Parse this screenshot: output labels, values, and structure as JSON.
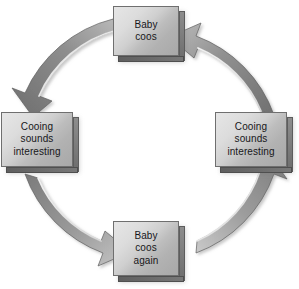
{
  "diagram": {
    "type": "cycle-diagram",
    "direction": "counterclockwise",
    "colors": {
      "background": "#ffffff",
      "box_face_light": "#e6e6e6",
      "box_face_dark": "#a8a8a8",
      "box_border": "#6f6f6f",
      "box_side": "#6d6d6d",
      "ring_light": "#d9d9d9",
      "ring_mid": "#9a9a9a",
      "ring_dark": "#6b6b6b",
      "text": "#17171a"
    },
    "nodes": [
      {
        "id": "top",
        "position": "top",
        "lines": [
          "Baby",
          "coos"
        ]
      },
      {
        "id": "left",
        "position": "left",
        "lines": [
          "Cooing",
          "sounds",
          "interesting"
        ]
      },
      {
        "id": "bottom",
        "position": "bottom",
        "lines": [
          "Baby",
          "coos",
          "again"
        ]
      },
      {
        "id": "right",
        "position": "right",
        "lines": [
          "Cooing",
          "sounds",
          "interesting"
        ]
      }
    ],
    "arrows": [
      {
        "id": "top-to-left",
        "from": "top",
        "to": "left",
        "label": ""
      },
      {
        "id": "left-to-bottom",
        "from": "left",
        "to": "bottom",
        "label": ""
      },
      {
        "id": "bottom-to-right",
        "from": "bottom",
        "to": "right",
        "label": ""
      },
      {
        "id": "right-to-top",
        "from": "right",
        "to": "top",
        "label": ""
      }
    ]
  }
}
